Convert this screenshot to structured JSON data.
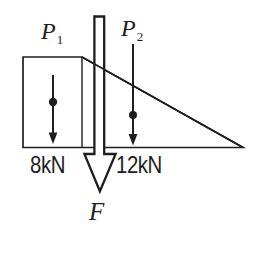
{
  "figure": {
    "background_color": "#ffffff",
    "ink_color": "#1e1e1e",
    "forces": {
      "p1": {
        "symbol": "P",
        "subscript": "1",
        "value": "8kN"
      },
      "p2": {
        "symbol": "P",
        "subscript": "2",
        "value": "12kN"
      },
      "resultant": {
        "symbol": "F"
      }
    }
  }
}
